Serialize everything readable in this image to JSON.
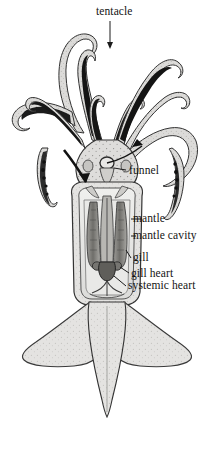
{
  "figure": {
    "background_color": "#ffffff",
    "ink_color": "#141414",
    "body_fill_color": "#d9d9d6",
    "body_fill_dark": "#b4b4b0",
    "sucker_band_color": "#1a1a1a",
    "organ_color": "#8c8c8c",
    "heart_color": "#5a5a5a"
  },
  "labels": [
    {
      "id": "tentacle",
      "text": "tentacle",
      "pointer": "arrow-down"
    },
    {
      "id": "funnel",
      "text": "funnel",
      "pointer": "leader-line"
    },
    {
      "id": "mantle",
      "text": "mantle",
      "pointer": "leader-dash"
    },
    {
      "id": "mantle_cavity",
      "text": "mantle cavity",
      "pointer": "leader-dash"
    },
    {
      "id": "gill",
      "text": "gill",
      "pointer": "leader-dash"
    },
    {
      "id": "gill_heart",
      "text": "gill heart",
      "pointer": "leader-dash"
    },
    {
      "id": "systemic_heart",
      "text": "systemic heart",
      "pointer": "leader-dash"
    }
  ],
  "label_text": {
    "tentacle": "tentacle",
    "funnel": "funnel",
    "mantle": "mantle",
    "mantle_cavity": "mantle cavity",
    "gill": "gill",
    "gill_heart": "gill heart",
    "systemic_heart": "systemic heart"
  },
  "anatomy_parts": [
    {
      "name": "arms",
      "count": 8,
      "note": "shorter appendages with dark sucker-bearing inner faces"
    },
    {
      "name": "tentacles",
      "count": 2,
      "note": "long feeding tentacles with terminal clubs"
    },
    {
      "name": "head",
      "count": 1,
      "note": "stippled, bears eyes"
    },
    {
      "name": "funnel",
      "count": 1,
      "note": "siphon on ventral head, water jet outflow"
    },
    {
      "name": "mantle",
      "count": 1,
      "note": "muscular body wall, cut open ventrally"
    },
    {
      "name": "mantle_cavity",
      "count": 1,
      "note": "internal space between mantle and viscera"
    },
    {
      "name": "gill",
      "count": 2,
      "note": "paired ctenidia inside mantle cavity"
    },
    {
      "name": "gill_heart",
      "count": 2,
      "note": "branchial hearts at gill bases"
    },
    {
      "name": "systemic_heart",
      "count": 1,
      "note": "central heart between branchial hearts"
    },
    {
      "name": "fins",
      "count": 2,
      "note": "lateral rhombic fins forming the tail"
    }
  ],
  "flow_arrows": [
    {
      "id": "inflow-arrow",
      "direction": "down",
      "note": "water entering mantle cavity at mantle opening"
    },
    {
      "id": "outflow-arrow",
      "direction": "up-right",
      "note": "water expelled through funnel"
    }
  ]
}
